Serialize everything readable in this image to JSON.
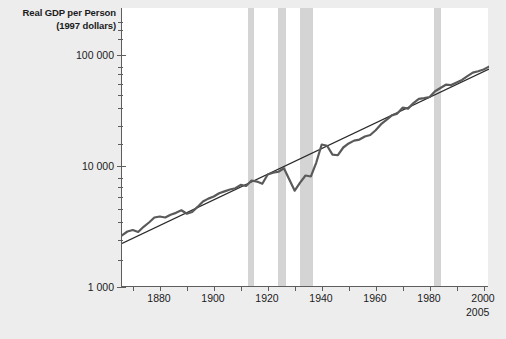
{
  "chart_data": {
    "type": "line",
    "title": "Real GDP per Person",
    "subtitle": "(1997 dollars)",
    "ylabel": "Real GDP per Person (1997 dollars)",
    "xlabel": "",
    "yscale": "log",
    "ylim": [
      1000,
      100000
    ],
    "xlim": [
      1869,
      2005
    ],
    "grid": false,
    "legend": "none",
    "ytick_labels": [
      "100 000",
      "10 000",
      "1 000"
    ],
    "ytick_values": [
      100000,
      10000,
      1000
    ],
    "xtick_labels": [
      "1880",
      "1900",
      "1920",
      "1940",
      "1960",
      "1980",
      "2000"
    ],
    "xtick_values": [
      1880,
      1900,
      1920,
      1940,
      1960,
      1980,
      2000
    ],
    "axis_end_label": "2005",
    "series": [
      {
        "name": "Real GDP per person",
        "type": "line",
        "color": "#5a5a5a",
        "x": [
          1869,
          1871,
          1873,
          1875,
          1877,
          1879,
          1881,
          1883,
          1885,
          1887,
          1889,
          1891,
          1893,
          1895,
          1897,
          1899,
          1901,
          1903,
          1905,
          1907,
          1909,
          1911,
          1913,
          1915,
          1917,
          1919,
          1921,
          1923,
          1925,
          1927,
          1929,
          1931,
          1933,
          1935,
          1937,
          1939,
          1941,
          1943,
          1945,
          1947,
          1949,
          1951,
          1953,
          1955,
          1957,
          1959,
          1961,
          1963,
          1965,
          1967,
          1969,
          1971,
          1973,
          1975,
          1977,
          1979,
          1981,
          1983,
          1985,
          1987,
          1989,
          1991,
          1993,
          1995,
          1997,
          1999,
          2001,
          2003,
          2005
        ],
        "y": [
          2350,
          2500,
          2560,
          2480,
          2700,
          2900,
          3150,
          3200,
          3150,
          3300,
          3400,
          3550,
          3350,
          3450,
          3750,
          4100,
          4300,
          4450,
          4700,
          4850,
          5000,
          5100,
          5400,
          5300,
          5800,
          5700,
          5500,
          6400,
          6600,
          6700,
          7100,
          5900,
          4900,
          5600,
          6300,
          6200,
          7800,
          10500,
          10300,
          8900,
          8800,
          10000,
          10700,
          11200,
          11400,
          12000,
          12300,
          13300,
          14700,
          15800,
          17000,
          17500,
          19300,
          19000,
          20800,
          22300,
          22600,
          23000,
          25300,
          26700,
          28200,
          28000,
          29200,
          30500,
          32500,
          34400,
          35200,
          36200,
          38000
        ]
      },
      {
        "name": "Long-run trend",
        "type": "line",
        "color": "#2a2a2a",
        "x": [
          1869,
          2005
        ],
        "y": [
          2050,
          36500
        ]
      }
    ],
    "shaded_bands": [
      {
        "label": "war/recession band",
        "x0": 1916,
        "x1": 1918
      },
      {
        "label": "war/recession band",
        "x0": 1927,
        "x1": 1930
      },
      {
        "label": "war/recession band",
        "x0": 1935,
        "x1": 1940
      },
      {
        "label": "war/recession band",
        "x0": 1985,
        "x1": 1988
      }
    ],
    "colors": {
      "background": "#ededee",
      "plot_background": "#ffffff",
      "axis": "#5d5d5d",
      "series": "#5a5a5a",
      "trend": "#2a2a2a",
      "band": "#d2d2d2",
      "text": "#1b1b1b"
    }
  }
}
